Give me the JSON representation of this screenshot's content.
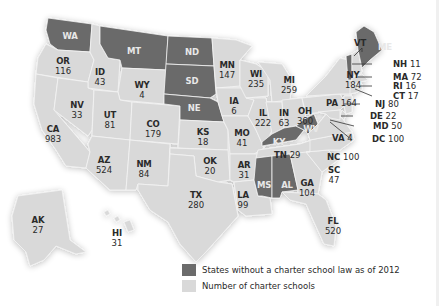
{
  "map": {
    "type": "choropleth",
    "subject": "Number of charter schools by US state",
    "colors": {
      "no_law": "#6b6b6b",
      "with_law": "#d9d9d9"
    }
  },
  "legend": {
    "items": [
      {
        "label": "States without a charter school law as of 2012",
        "color": "#6b6b6b"
      },
      {
        "label": "Number of charter schools",
        "color": "#d9d9d9"
      }
    ]
  },
  "states_no_law": [
    {
      "abbr": "WA"
    },
    {
      "abbr": "MT"
    },
    {
      "abbr": "ND"
    },
    {
      "abbr": "SD"
    },
    {
      "abbr": "NE"
    },
    {
      "abbr": "KY"
    },
    {
      "abbr": "WV"
    },
    {
      "abbr": "MS"
    },
    {
      "abbr": "AL"
    },
    {
      "abbr": "VT"
    },
    {
      "abbr": "ME"
    }
  ],
  "states": {
    "OR": {
      "abbr": "OR",
      "value": "116"
    },
    "ID": {
      "abbr": "ID",
      "value": "43"
    },
    "WY": {
      "abbr": "WY",
      "value": "4"
    },
    "NV": {
      "abbr": "NV",
      "value": "33"
    },
    "UT": {
      "abbr": "UT",
      "value": "81"
    },
    "CO": {
      "abbr": "CO",
      "value": "179"
    },
    "CA": {
      "abbr": "CA",
      "value": "983"
    },
    "AZ": {
      "abbr": "AZ",
      "value": "524"
    },
    "NM": {
      "abbr": "NM",
      "value": "84"
    },
    "KS": {
      "abbr": "KS",
      "value": "18"
    },
    "OK": {
      "abbr": "OK",
      "value": "20"
    },
    "TX": {
      "abbr": "TX",
      "value": "280"
    },
    "MN": {
      "abbr": "MN",
      "value": "147"
    },
    "IA": {
      "abbr": "IA",
      "value": "6"
    },
    "MO": {
      "abbr": "MO",
      "value": "41"
    },
    "AR": {
      "abbr": "AR",
      "value": "31"
    },
    "LA": {
      "abbr": "LA",
      "value": "99"
    },
    "WI": {
      "abbr": "WI",
      "value": "235"
    },
    "IL": {
      "abbr": "IL",
      "value": "222"
    },
    "MI": {
      "abbr": "MI",
      "value": "259"
    },
    "IN": {
      "abbr": "IN",
      "value": "63"
    },
    "OH": {
      "abbr": "OH",
      "value": "360"
    },
    "TN": {
      "abbr": "TN",
      "value": "29"
    },
    "GA": {
      "abbr": "GA",
      "value": "104"
    },
    "FL": {
      "abbr": "FL",
      "value": "520"
    },
    "SC": {
      "abbr": "SC",
      "value": "47"
    },
    "NC": {
      "abbr": "NC",
      "value": "100"
    },
    "VA": {
      "abbr": "VA",
      "value": "4"
    },
    "PA": {
      "abbr": "PA",
      "value": "164"
    },
    "NY": {
      "abbr": "NY",
      "value": "184"
    },
    "NH": {
      "abbr": "NH",
      "value": "11"
    },
    "MA": {
      "abbr": "MA",
      "value": "72"
    },
    "RI": {
      "abbr": "RI",
      "value": "16"
    },
    "CT": {
      "abbr": "CT",
      "value": "17"
    },
    "NJ": {
      "abbr": "NJ",
      "value": "80"
    },
    "DE": {
      "abbr": "DE",
      "value": "22"
    },
    "MD": {
      "abbr": "MD",
      "value": "50"
    },
    "DC": {
      "abbr": "DC",
      "value": "100"
    },
    "AK": {
      "abbr": "AK",
      "value": "27"
    },
    "HI": {
      "abbr": "HI",
      "value": "31"
    }
  },
  "dark_labels": {
    "WA": "WA",
    "MT": "MT",
    "ND": "ND",
    "SD": "SD",
    "NE": "NE",
    "KY": "KY",
    "WV": "WV",
    "MS": "MS",
    "AL": "AL",
    "VT": "VT",
    "ME": "ME"
  }
}
